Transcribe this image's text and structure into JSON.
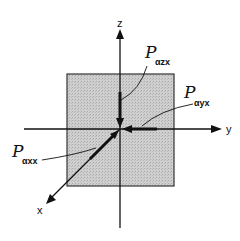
{
  "diagram": {
    "axes": {
      "z": {
        "label": "z"
      },
      "y": {
        "label": "y"
      },
      "x": {
        "label": "x"
      }
    },
    "plane": {
      "fill": "#c8c8c8",
      "stroke": "#333333"
    },
    "vectors": [
      {
        "symbol": "P",
        "subscript": "αzx",
        "direction": "along -z toward origin"
      },
      {
        "symbol": "P",
        "subscript": "αyx",
        "direction": "along -y toward origin"
      },
      {
        "symbol": "P",
        "subscript": "αxx",
        "direction": "along x from origin"
      }
    ]
  }
}
